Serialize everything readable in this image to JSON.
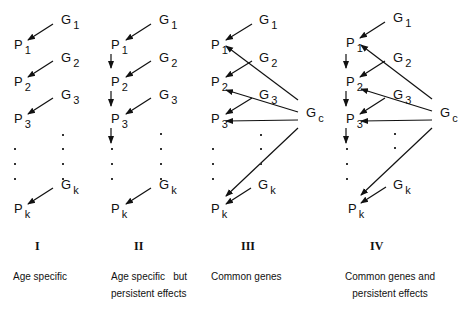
{
  "panels": [
    {
      "roman": "I",
      "caption_line1": "Age specific",
      "caption_line2": ""
    },
    {
      "roman": "II",
      "caption_line1": "Age specific   but",
      "caption_line2": "persistent effects"
    },
    {
      "roman": "III",
      "caption_line1": "Common genes",
      "caption_line2": ""
    },
    {
      "roman": "IV",
      "caption_line1": "Common genes and",
      "caption_line2": "persistent effects"
    }
  ],
  "nodes": {
    "P": "P",
    "G": "G",
    "sub1": "1",
    "sub2": "2",
    "sub3": "3",
    "subk": "k",
    "subc": "c"
  }
}
